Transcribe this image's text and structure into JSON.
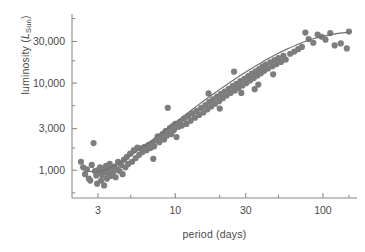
{
  "chart_data": {
    "type": "scatter",
    "title": "",
    "xlabel": "period (days)",
    "ylabel_full": "luminosity (L_Sun)",
    "ylabel_main": "luminosity (",
    "ylabel_symbol": "L",
    "ylabel_subscript": "Sun",
    "ylabel_close": ")",
    "xscale": "log",
    "yscale": "log",
    "xlim": [
      2.0,
      170.0
    ],
    "ylim": [
      480,
      62000
    ],
    "xticks": [
      3,
      10,
      30,
      100
    ],
    "xtick_labels": [
      "3",
      "10",
      "30",
      "100"
    ],
    "xminor_ticks": [
      5,
      20,
      50,
      150
    ],
    "yticks": [
      1000,
      3000,
      10000,
      30000
    ],
    "ytick_labels": [
      "1,000",
      "3,000",
      "10,000",
      "30,000"
    ],
    "yminor_ticks": [
      550,
      1800,
      5500,
      18000,
      55000
    ],
    "grid": false,
    "legend": "none",
    "marker_color": "#7d7d7d",
    "curve_color": "#6e6e6e",
    "axis_color": "#8a8a8a",
    "text_color": "#4a4a4a",
    "marker_size_px": 3.1,
    "n_points": 141,
    "series": [
      {
        "name": "Cepheid variables",
        "points": [
          [
            2.3,
            1250
          ],
          [
            2.38,
            1080
          ],
          [
            2.45,
            900
          ],
          [
            2.52,
            1020
          ],
          [
            2.6,
            800
          ],
          [
            2.66,
            760
          ],
          [
            2.72,
            1150
          ],
          [
            2.8,
            2050
          ],
          [
            2.86,
            980
          ],
          [
            2.92,
            870
          ],
          [
            2.96,
            700
          ],
          [
            3.0,
            1000
          ],
          [
            3.05,
            930
          ],
          [
            3.1,
            1080
          ],
          [
            3.15,
            760
          ],
          [
            3.2,
            880
          ],
          [
            3.25,
            1010
          ],
          [
            3.3,
            670
          ],
          [
            3.35,
            950
          ],
          [
            3.4,
            1120
          ],
          [
            3.45,
            800
          ],
          [
            3.5,
            1020
          ],
          [
            3.55,
            900
          ],
          [
            3.6,
            1180
          ],
          [
            3.66,
            860
          ],
          [
            3.72,
            1000
          ],
          [
            3.8,
            940
          ],
          [
            3.88,
            1100
          ],
          [
            3.95,
            830
          ],
          [
            4.02,
            1020
          ],
          [
            4.1,
            1250
          ],
          [
            4.2,
            980
          ],
          [
            4.3,
            1150
          ],
          [
            4.4,
            900
          ],
          [
            4.5,
            1320
          ],
          [
            4.6,
            1080
          ],
          [
            4.7,
            1420
          ],
          [
            4.8,
            1180
          ],
          [
            4.95,
            1550
          ],
          [
            5.1,
            1250
          ],
          [
            5.25,
            1700
          ],
          [
            5.4,
            1380
          ],
          [
            5.55,
            1820
          ],
          [
            5.7,
            1500
          ],
          [
            5.85,
            1780
          ],
          [
            6.0,
            1620
          ],
          [
            6.2,
            1860
          ],
          [
            6.4,
            1700
          ],
          [
            6.6,
            1950
          ],
          [
            6.8,
            1800
          ],
          [
            7.0,
            2050
          ],
          [
            7.2,
            1880
          ],
          [
            7.1,
            1350
          ],
          [
            7.4,
            2200
          ],
          [
            7.6,
            2450
          ],
          [
            7.8,
            2100
          ],
          [
            8.0,
            2350
          ],
          [
            8.2,
            2600
          ],
          [
            8.4,
            2250
          ],
          [
            8.6,
            2820
          ],
          [
            8.8,
            2500
          ],
          [
            8.9,
            5200
          ],
          [
            9.0,
            2750
          ],
          [
            9.2,
            3050
          ],
          [
            9.4,
            2600
          ],
          [
            9.6,
            3200
          ],
          [
            9.8,
            2900
          ],
          [
            10.0,
            3400
          ],
          [
            10.2,
            2400
          ],
          [
            10.5,
            3150
          ],
          [
            10.8,
            3600
          ],
          [
            11.1,
            3250
          ],
          [
            11.5,
            3900
          ],
          [
            11.9,
            3400
          ],
          [
            12.3,
            4200
          ],
          [
            12.7,
            3700
          ],
          [
            13.1,
            4500
          ],
          [
            13.6,
            4000
          ],
          [
            14.0,
            4800
          ],
          [
            14.5,
            4300
          ],
          [
            15.0,
            5200
          ],
          [
            15.5,
            4600
          ],
          [
            16.0,
            5600
          ],
          [
            16.5,
            5000
          ],
          [
            17.0,
            6100
          ],
          [
            17.5,
            5400
          ],
          [
            16.8,
            7600
          ],
          [
            18.0,
            6500
          ],
          [
            18.6,
            5800
          ],
          [
            19.2,
            7000
          ],
          [
            19.8,
            6200
          ],
          [
            20.4,
            7500
          ],
          [
            21.0,
            6700
          ],
          [
            20.0,
            5100
          ],
          [
            21.6,
            8000
          ],
          [
            22.3,
            7200
          ],
          [
            23.0,
            8600
          ],
          [
            23.7,
            7700
          ],
          [
            24.5,
            9200
          ],
          [
            25.3,
            8200
          ],
          [
            26.0,
            9800
          ],
          [
            26.8,
            8800
          ],
          [
            25.0,
            13500
          ],
          [
            27.6,
            10500
          ],
          [
            28.5,
            9400
          ],
          [
            29.4,
            11200
          ],
          [
            30.3,
            10000
          ],
          [
            31.2,
            12000
          ],
          [
            32.1,
            10700
          ],
          [
            28.0,
            7700
          ],
          [
            33.0,
            12800
          ],
          [
            34.0,
            11400
          ],
          [
            35.0,
            13600
          ],
          [
            36.0,
            12200
          ],
          [
            34.5,
            8500
          ],
          [
            37.0,
            14500
          ],
          [
            38.0,
            13000
          ],
          [
            39.0,
            15400
          ],
          [
            40.0,
            13800
          ],
          [
            36.5,
            9600
          ],
          [
            41.0,
            16300
          ],
          [
            42.5,
            14700
          ],
          [
            44.0,
            17300
          ],
          [
            45.5,
            15600
          ],
          [
            47.0,
            18300
          ],
          [
            48.5,
            16500
          ],
          [
            50.0,
            19400
          ],
          [
            46.0,
            12600
          ],
          [
            52.0,
            17500
          ],
          [
            54.0,
            20500
          ],
          [
            56.0,
            18600
          ],
          [
            60.0,
            21700
          ],
          [
            64.0,
            23000
          ],
          [
            68.0,
            24500
          ],
          [
            72.0,
            26000
          ],
          [
            76.0,
            38000
          ],
          [
            80.0,
            32000
          ],
          [
            86.0,
            29000
          ],
          [
            92.0,
            36000
          ],
          [
            98.0,
            34000
          ],
          [
            104.0,
            31500
          ],
          [
            112.0,
            37500
          ],
          [
            120.0,
            27000
          ],
          [
            132.0,
            28500
          ],
          [
            145.0,
            25000
          ],
          [
            150.0,
            39000
          ]
        ]
      }
    ],
    "fit_curve": {
      "name": "period-luminosity relation",
      "points": [
        [
          2.55,
          980
        ],
        [
          2.8,
          960
        ],
        [
          3.0,
          960
        ],
        [
          3.3,
          1000
        ],
        [
          3.7,
          1080
        ],
        [
          4.2,
          1220
        ],
        [
          4.8,
          1420
        ],
        [
          5.5,
          1650
        ],
        [
          6.3,
          1950
        ],
        [
          7.2,
          2300
        ],
        [
          8.2,
          2750
        ],
        [
          9.4,
          3250
        ],
        [
          10.8,
          3900
        ],
        [
          12.4,
          4650
        ],
        [
          14.2,
          5550
        ],
        [
          16.3,
          6600
        ],
        [
          18.7,
          7800
        ],
        [
          21.5,
          9200
        ],
        [
          24.7,
          10800
        ],
        [
          28.4,
          12600
        ],
        [
          32.6,
          14600
        ],
        [
          37.5,
          16800
        ],
        [
          43.0,
          19200
        ],
        [
          49.5,
          21800
        ],
        [
          57.0,
          24500
        ],
        [
          65.5,
          27200
        ],
        [
          75.0,
          29800
        ],
        [
          86.0,
          32200
        ],
        [
          99.0,
          34300
        ],
        [
          114.0,
          36000
        ],
        [
          131.0,
          37400
        ],
        [
          150.0,
          38300
        ]
      ]
    }
  }
}
